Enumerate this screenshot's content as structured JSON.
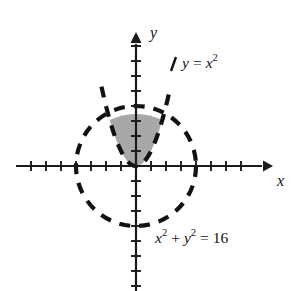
{
  "figure": {
    "background_color": "#ffffff",
    "curve_color": "#111111",
    "axis_color": "#1a1a1a",
    "shade_color": "#a8a8a8"
  },
  "axes": {
    "x_axis_label": "x",
    "y_axis_label": "y",
    "origin_px": {
      "x": 136,
      "y": 166
    },
    "unit_px": 15,
    "x_ticks": [
      -7,
      -6,
      -5,
      -4,
      -3,
      -2,
      -1,
      1,
      2,
      3,
      4,
      5,
      6,
      7
    ],
    "y_ticks": [
      -8,
      -7,
      -6,
      -5,
      -4,
      -3,
      -2,
      -1,
      1,
      2,
      3,
      4,
      5,
      6,
      7,
      8
    ],
    "x_range": [
      -8,
      8
    ],
    "y_range": [
      -9,
      8
    ],
    "has_arrowheads": true,
    "gridlines": false
  },
  "labels": {
    "parabola": {
      "lhs": "y",
      "equals": "=",
      "base": "x",
      "exponent": "2",
      "full_text": "y = x²"
    },
    "circle": {
      "term1_base": "x",
      "term1_exp": "2",
      "plus": "+",
      "term2_base": "y",
      "term2_exp": "2",
      "equals": "=",
      "value": "16",
      "full_text": "x² + y² = 16"
    }
  },
  "chart_data": {
    "type": "line",
    "xlabel": "x",
    "ylabel": "y",
    "xlim": [
      -8,
      8
    ],
    "ylim": [
      -9,
      8
    ],
    "grid": false,
    "legend": "none",
    "series": [
      {
        "name": "y = x²",
        "equation": "y = x^2",
        "style": "dashed",
        "color": "#111111",
        "vertex": [
          0,
          0
        ],
        "x_domain": [
          -2.3,
          2.3
        ]
      },
      {
        "name": "x² + y² = 16",
        "equation": "x^2 + y^2 = 16",
        "style": "dashed",
        "color": "#111111",
        "center": [
          0,
          0
        ],
        "radius": 4,
        "x_intercepts": [
          -4,
          4
        ],
        "y_intercepts": [
          -4,
          4
        ]
      }
    ],
    "shaded_region": {
      "label": "region between parabola and circle",
      "fill_color": "#a8a8a8",
      "lower_boundary": "y = x^2",
      "upper_boundary": "x^2 + y^2 = 16",
      "intersection_points": [
        [
          -1.7489,
          3.0587
        ],
        [
          1.7489,
          3.0587
        ]
      ]
    },
    "annotations": [
      {
        "text": "y = x²",
        "x": 2.6,
        "y": 5.6
      },
      {
        "text": "x² + y² = 16",
        "x": 1.6,
        "y": -4.6
      }
    ]
  }
}
